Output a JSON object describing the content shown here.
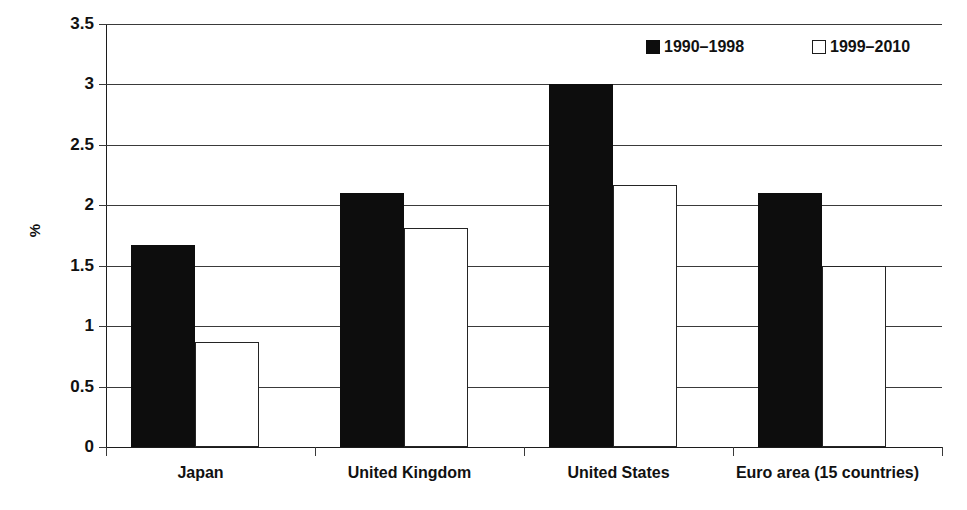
{
  "chart_data": {
    "type": "bar",
    "title": "",
    "subtitle": "",
    "xlabel": "",
    "ylabel": "%",
    "categories": [
      "Japan",
      "United Kingdom",
      "United States",
      "Euro area (15 countries)"
    ],
    "series": [
      {
        "name": "1990–1998",
        "values": [
          1.67,
          2.1,
          3.0,
          2.1
        ],
        "color": "#0d0d0d",
        "fill": "solid"
      },
      {
        "name": "1999–2010",
        "values": [
          0.87,
          1.81,
          2.17,
          1.5
        ],
        "color": "#ffffff",
        "fill": "outline"
      }
    ],
    "ylim": [
      0,
      3.5
    ],
    "yticks": [
      0,
      0.5,
      1,
      1.5,
      2,
      2.5,
      3,
      3.5
    ],
    "ytick_labels": [
      "0",
      "0.5",
      "1",
      "1.5",
      "2",
      "2.5",
      "3",
      "3.5"
    ],
    "grid": true,
    "grid_axis": "y",
    "legend_position": "top-right",
    "orientation": "vertical"
  },
  "axis": {
    "y_title": "%"
  },
  "legend": {
    "entries": [
      {
        "label": "1990–1998",
        "swatch": "filled-square-dark"
      },
      {
        "label": "1999–2010",
        "swatch": "outlined-square-light"
      }
    ]
  },
  "colors": {
    "series_dark": "#0d0d0d",
    "series_light": "#ffffff",
    "grid": "#3a3a3a",
    "axis": "#1c1c1c",
    "text": "#111111",
    "background": "#ffffff"
  }
}
